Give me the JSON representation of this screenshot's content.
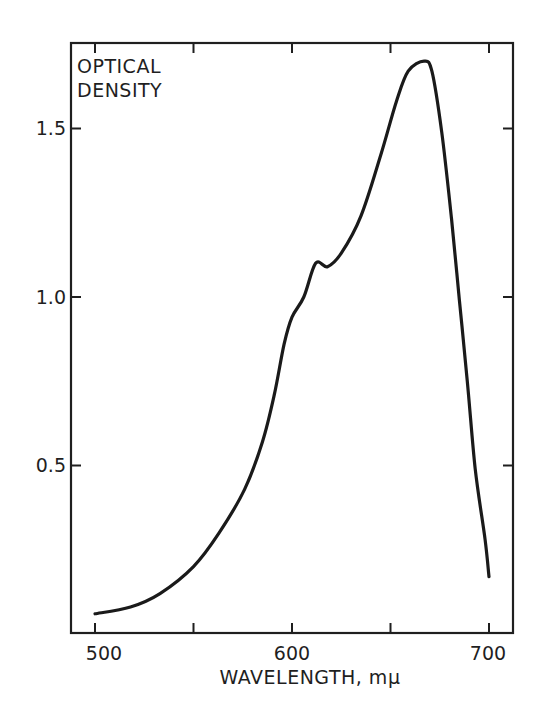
{
  "chart_data": {
    "type": "line",
    "title": "",
    "xlabel": "WAVELENGTH, mμ",
    "ylabel": "OPTICAL DENSITY",
    "ylabel_lines": [
      "OPTICAL",
      "DENSITY"
    ],
    "xlim": [
      488,
      713
    ],
    "ylim": [
      0.0,
      1.76
    ],
    "x_ticks": [
      500,
      550,
      600,
      650,
      700
    ],
    "x_tick_labels": [
      "500",
      "",
      "600",
      "",
      "700"
    ],
    "y_ticks": [
      0.5,
      1.0,
      1.5
    ],
    "y_tick_labels": [
      "0.5",
      "1.0",
      "1.5"
    ],
    "grid": false,
    "legend": null,
    "series": [
      {
        "name": "absorption spectrum",
        "color": "#1a1a1a",
        "x": [
          500,
          518,
          533,
          550,
          563,
          576,
          585,
          591,
          596,
          600,
          606,
          612,
          618,
          625,
          635,
          645,
          653,
          659,
          667,
          671,
          676,
          681,
          685,
          689,
          693,
          698,
          700
        ],
        "y": [
          0.06,
          0.08,
          0.12,
          0.2,
          0.3,
          0.43,
          0.57,
          0.71,
          0.86,
          0.94,
          1.0,
          1.1,
          1.09,
          1.13,
          1.24,
          1.42,
          1.58,
          1.67,
          1.7,
          1.67,
          1.49,
          1.23,
          0.99,
          0.75,
          0.49,
          0.28,
          0.17
        ]
      }
    ],
    "annotations": []
  },
  "labels": {
    "ylabel_line1": "OPTICAL",
    "ylabel_line2": "DENSITY",
    "xlabel": "WAVELENGTH, mμ",
    "xtick_500": "500",
    "xtick_600": "600",
    "xtick_700": "700",
    "ytick_05": "0.5",
    "ytick_10": "1.0",
    "ytick_15": "1.5"
  }
}
